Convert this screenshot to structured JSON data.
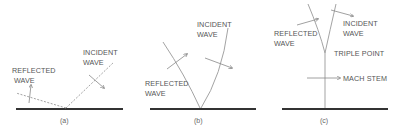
{
  "figure": {
    "panels": [
      {
        "id": "a",
        "caption": "(a)",
        "labels": {
          "reflected_line1": "REFLECTED",
          "reflected_line2": "WAVE",
          "incident_line1": "INCIDENT",
          "incident_line2": "WAVE"
        }
      },
      {
        "id": "b",
        "caption": "(b)",
        "labels": {
          "incident_line1": "INCIDENT",
          "incident_line2": "WAVE",
          "reflected_line1": "REFLECTED",
          "reflected_line2": "WAVE"
        }
      },
      {
        "id": "c",
        "caption": "(c)",
        "labels": {
          "reflected_line1": "REFLECTED",
          "reflected_line2": "WAVE",
          "incident_line1": "INCIDENT",
          "incident_line2": "WAVE",
          "triple_point": "TRIPLE POINT",
          "mach_stem": "MACH STEM"
        }
      }
    ]
  }
}
